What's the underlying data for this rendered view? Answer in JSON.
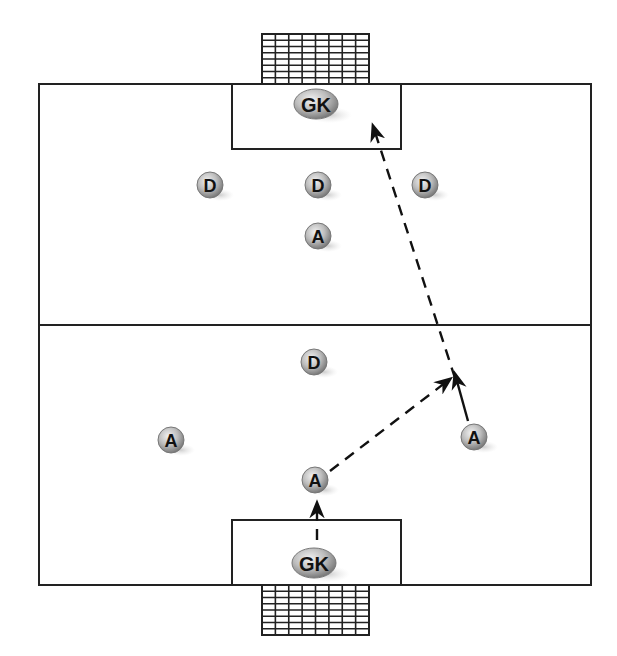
{
  "diagram": {
    "type": "soccer-drill",
    "field": {
      "x": 39,
      "y": 84,
      "width": 552,
      "height": 501,
      "halfway_y": 325,
      "line_color": "#222222"
    },
    "penalty_boxes": [
      {
        "id": "top",
        "x": 232,
        "y": 84,
        "width": 169,
        "height": 65
      },
      {
        "id": "bottom",
        "x": 232,
        "y": 520,
        "width": 169,
        "height": 65
      }
    ],
    "goals": [
      {
        "id": "top-net",
        "x": 262,
        "y": 34,
        "width": 107,
        "height": 50,
        "cols": 8,
        "rows": 8
      },
      {
        "id": "bottom-net",
        "x": 262,
        "y": 585,
        "width": 107,
        "height": 50,
        "cols": 8,
        "rows": 8
      }
    ],
    "players": [
      {
        "id": "gk-top",
        "label": "GK",
        "role": "goalkeeper",
        "x": 316,
        "y": 104,
        "shape": "ellipse"
      },
      {
        "id": "d-left",
        "label": "D",
        "role": "defender",
        "x": 210,
        "y": 185,
        "shape": "circle"
      },
      {
        "id": "d-center",
        "label": "D",
        "role": "defender",
        "x": 318,
        "y": 185,
        "shape": "circle"
      },
      {
        "id": "d-right",
        "label": "D",
        "role": "defender",
        "x": 425,
        "y": 185,
        "shape": "circle"
      },
      {
        "id": "a-top",
        "label": "A",
        "role": "attacker",
        "x": 318,
        "y": 236,
        "shape": "circle"
      },
      {
        "id": "d-lower",
        "label": "D",
        "role": "defender",
        "x": 314,
        "y": 362,
        "shape": "circle"
      },
      {
        "id": "a-left",
        "label": "A",
        "role": "attacker",
        "x": 171,
        "y": 440,
        "shape": "circle"
      },
      {
        "id": "a-right",
        "label": "A",
        "role": "attacker",
        "x": 474,
        "y": 437,
        "shape": "circle"
      },
      {
        "id": "a-center",
        "label": "A",
        "role": "attacker",
        "x": 315,
        "y": 480,
        "shape": "circle"
      },
      {
        "id": "gk-bottom",
        "label": "GK",
        "role": "goalkeeper",
        "x": 314,
        "y": 563,
        "shape": "ellipse"
      }
    ],
    "paths": [
      {
        "id": "gk-distribution",
        "style": "dashed",
        "from": [
          317,
          540
        ],
        "to": [
          317,
          503
        ]
      },
      {
        "id": "pass-to-run",
        "style": "dashed",
        "from": [
          330,
          471
        ],
        "to": [
          450,
          379
        ]
      },
      {
        "id": "run-forward",
        "style": "solid",
        "from": [
          468,
          421
        ],
        "to": [
          455,
          374
        ]
      },
      {
        "id": "shot-on-goal",
        "style": "dashed",
        "from": [
          455,
          378
        ],
        "to": [
          373,
          126
        ]
      }
    ]
  }
}
